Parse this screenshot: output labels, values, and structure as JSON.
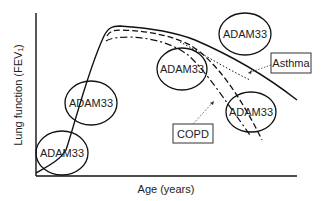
{
  "diagram": {
    "x_axis_label": "Age (years)",
    "y_axis_label": "Lung function (FEV₁)",
    "gene_label": "ADAM33",
    "callouts": {
      "asthma": "Asthma",
      "copd": "COPD"
    },
    "curves": [
      {
        "name": "normal",
        "style": "solid"
      },
      {
        "name": "asthma",
        "style": "dotted"
      },
      {
        "name": "copd-dashed",
        "style": "dashed"
      },
      {
        "name": "copd-dashdot",
        "style": "dash-dot"
      }
    ],
    "ellipses": [
      {
        "label": "ADAM33",
        "position": "early-life"
      },
      {
        "label": "ADAM33",
        "position": "growth"
      },
      {
        "label": "ADAM33",
        "position": "plateau-top"
      },
      {
        "label": "ADAM33",
        "position": "decline-start"
      },
      {
        "label": "ADAM33",
        "position": "late-decline"
      }
    ]
  }
}
